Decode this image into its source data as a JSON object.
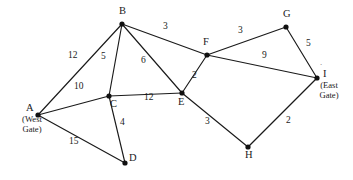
{
  "figure": {
    "kind": "weighted-undirected-graph",
    "background_color": "#ffffff",
    "line_color": "#1a1a1a",
    "vertex_color": "#111111"
  },
  "nodes": [
    {
      "id": "A",
      "label": "A",
      "x": 38,
      "y": 115,
      "note": "(West\nGate)",
      "note_line1": "(West",
      "note_line2": "Gate)",
      "label_dx": -12,
      "label_dy": -13
    },
    {
      "id": "B",
      "label": "B",
      "x": 122,
      "y": 24,
      "note": "",
      "label_dx": -3,
      "label_dy": -19
    },
    {
      "id": "C",
      "label": "C",
      "x": 109,
      "y": 96,
      "note": "",
      "label_dx": 1,
      "label_dy": 2
    },
    {
      "id": "D",
      "label": "D",
      "x": 125,
      "y": 163,
      "note": "",
      "label_dx": 4,
      "label_dy": -11
    },
    {
      "id": "E",
      "label": "E",
      "x": 182,
      "y": 93,
      "note": "",
      "label_dx": -4,
      "label_dy": 3
    },
    {
      "id": "F",
      "label": "F",
      "x": 207,
      "y": 55,
      "note": "",
      "label_dx": -4,
      "label_dy": -19
    },
    {
      "id": "G",
      "label": "G",
      "x": 286,
      "y": 27,
      "note": "",
      "label_dx": -3,
      "label_dy": -19
    },
    {
      "id": "H",
      "label": "H",
      "x": 248,
      "y": 147,
      "note": "",
      "label_dx": -3,
      "label_dy": 2
    },
    {
      "id": "I",
      "label": "I",
      "x": 317,
      "y": 78,
      "note": "(East\nGate)",
      "note_line1": "(East",
      "note_line2": "Gate)",
      "label_dx": 6,
      "label_dy": -10
    }
  ],
  "edges": [
    {
      "from": "A",
      "to": "B",
      "weight": "12",
      "lx": 72,
      "ly": 57
    },
    {
      "from": "A",
      "to": "C",
      "weight": "10",
      "lx": 78,
      "ly": 88
    },
    {
      "from": "A",
      "to": "D",
      "weight": "15",
      "lx": 73,
      "ly": 143
    },
    {
      "from": "B",
      "to": "C",
      "weight": "5",
      "lx": 105,
      "ly": 58
    },
    {
      "from": "B",
      "to": "E",
      "weight": "6",
      "lx": 145,
      "ly": 62
    },
    {
      "from": "B",
      "to": "F",
      "weight": "3",
      "lx": 167,
      "ly": 28
    },
    {
      "from": "C",
      "to": "D",
      "weight": "4",
      "lx": 124,
      "ly": 124
    },
    {
      "from": "C",
      "to": "E",
      "weight": "12",
      "lx": 148,
      "ly": 99
    },
    {
      "from": "E",
      "to": "F",
      "weight": "2",
      "lx": 196,
      "ly": 77
    },
    {
      "from": "E",
      "to": "H",
      "weight": "3",
      "lx": 209,
      "ly": 123
    },
    {
      "from": "F",
      "to": "G",
      "weight": "3",
      "lx": 242,
      "ly": 32
    },
    {
      "from": "F",
      "to": "I",
      "weight": "9",
      "lx": 266,
      "ly": 57
    },
    {
      "from": "G",
      "to": "I",
      "weight": "5",
      "lx": 310,
      "ly": 45
    },
    {
      "from": "H",
      "to": "I",
      "weight": "2",
      "lx": 290,
      "ly": 122
    }
  ],
  "artifacts": {
    "tick_above_i": "´",
    "tick_x": 320,
    "tick_y": 63
  }
}
